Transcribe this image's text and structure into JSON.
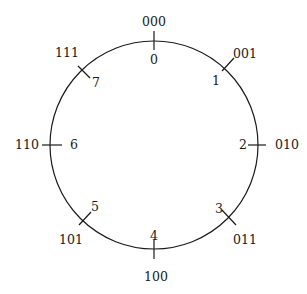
{
  "diagram": {
    "type": "circular-ring",
    "stroke_color": "#1a1a1a",
    "nodes": [
      {
        "index": "0",
        "binary": "000"
      },
      {
        "index": "1",
        "binary": "001"
      },
      {
        "index": "2",
        "binary": "010"
      },
      {
        "index": "3",
        "binary": "011"
      },
      {
        "index": "4",
        "binary": "100"
      },
      {
        "index": "5",
        "binary": "101"
      },
      {
        "index": "6",
        "binary": "110"
      },
      {
        "index": "7",
        "binary": "111"
      }
    ]
  }
}
